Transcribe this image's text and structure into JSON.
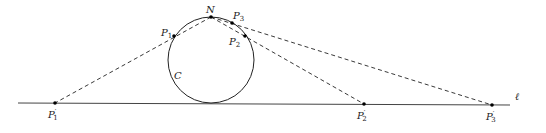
{
  "diagram": {
    "line": {
      "label": "ℓ",
      "x1": 18,
      "y1": 103,
      "x2": 510,
      "y2": 105
    },
    "circle": {
      "label": "C",
      "cx": 211,
      "cy": 60,
      "r": 43
    },
    "points": {
      "N": {
        "label": "N",
        "x": 211,
        "y": 17
      },
      "P1": {
        "label": "P1",
        "x": 174,
        "y": 36
      },
      "P2": {
        "label": "P2",
        "x": 245,
        "y": 36
      },
      "P3": {
        "label": "P3",
        "x": 232,
        "y": 23
      },
      "P1p": {
        "label": "P1'",
        "x": 55,
        "y": 103
      },
      "P2p": {
        "label": "P2'",
        "x": 364,
        "y": 104
      },
      "P3p": {
        "label": "P3'",
        "x": 492,
        "y": 105
      }
    },
    "colors": {
      "stroke": "#222222"
    }
  }
}
